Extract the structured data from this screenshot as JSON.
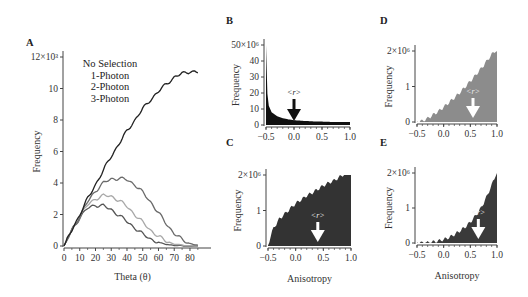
{
  "chart_data": [
    {
      "panel": "A",
      "type": "line",
      "title": "",
      "xlabel": "Theta (θ)",
      "ylabel": "Frequency",
      "y_multiplier_label": "12×10³",
      "xlim": [
        0,
        87
      ],
      "ylim": [
        0,
        12
      ],
      "x_ticks": [
        "0",
        "10",
        "20",
        "30",
        "40",
        "50",
        "60",
        "70",
        "80"
      ],
      "y_ticks": [
        "0",
        "2",
        "4",
        "6",
        "8",
        "10",
        "12×10³"
      ],
      "grid": false,
      "legend": [
        "No Selection",
        "1-Photon",
        "2-Photon",
        "3-Photon"
      ],
      "legend_position": "upper-left inside",
      "x": [
        0,
        5,
        10,
        15,
        20,
        25,
        30,
        35,
        40,
        45,
        50,
        55,
        60,
        65,
        70,
        75,
        80,
        85
      ],
      "series": [
        {
          "name": "No Selection",
          "color": "#222222",
          "values": [
            0,
            1.0,
            2.0,
            3.0,
            3.9,
            4.8,
            5.7,
            6.5,
            7.3,
            8.0,
            8.7,
            9.3,
            9.8,
            10.3,
            10.7,
            10.95,
            11.1,
            11.0
          ]
        },
        {
          "name": "1-Photon",
          "color": "#6a6a6a",
          "values": [
            0,
            1.0,
            1.9,
            2.8,
            3.5,
            4.0,
            4.25,
            4.3,
            4.2,
            3.9,
            3.4,
            2.8,
            2.1,
            1.4,
            0.8,
            0.4,
            0.15,
            0.05
          ]
        },
        {
          "name": "2-Photon",
          "color": "#a8a8a8",
          "values": [
            0,
            1.0,
            1.9,
            2.6,
            3.0,
            3.2,
            3.15,
            2.9,
            2.5,
            2.0,
            1.5,
            1.0,
            0.6,
            0.3,
            0.12,
            0.05,
            0.02,
            0.0
          ]
        },
        {
          "name": "3-Photon",
          "color": "#555555",
          "values": [
            0,
            1.0,
            1.8,
            2.4,
            2.6,
            2.55,
            2.3,
            1.95,
            1.55,
            1.15,
            0.75,
            0.45,
            0.22,
            0.1,
            0.04,
            0.01,
            0.0,
            0.0
          ]
        }
      ]
    },
    {
      "panel": "B",
      "type": "area",
      "xlabel": "",
      "ylabel": "Frequency",
      "xlim": [
        -0.5,
        1.0
      ],
      "ylim": [
        0,
        50
      ],
      "x_ticks": [
        "-0.5",
        "0.0",
        "0.5",
        "1.0"
      ],
      "y_ticks": [
        "0",
        "10",
        "20",
        "30",
        "40",
        "50×10⁶"
      ],
      "fill_color": "#111111",
      "annotation": {
        "text": "<r>",
        "x": 0.0,
        "arrow_color": "#111111"
      },
      "x": [
        -0.5,
        -0.48,
        -0.45,
        -0.4,
        -0.3,
        -0.2,
        -0.1,
        0.0,
        0.2,
        0.4,
        0.6,
        0.8,
        1.0
      ],
      "values": [
        50,
        21,
        12,
        8,
        5.5,
        4.2,
        3.5,
        3.0,
        2.5,
        2.2,
        2.0,
        1.8,
        1.8
      ]
    },
    {
      "panel": "C",
      "type": "area",
      "xlabel": "Anisotropy",
      "ylabel": "Frequency",
      "xlim": [
        -0.5,
        1.0
      ],
      "ylim": [
        0,
        2
      ],
      "x_ticks": [
        "-0.5",
        "0.0",
        "0.5",
        "1.0"
      ],
      "y_ticks": [
        "0",
        "1",
        "2×10⁶"
      ],
      "fill_color": "#333333",
      "annotation": {
        "text": "<r>",
        "x": 0.4,
        "arrow_color": "#ffffff"
      },
      "x": [
        -0.5,
        -0.45,
        -0.4,
        -0.3,
        -0.2,
        -0.1,
        0.0,
        0.1,
        0.2,
        0.3,
        0.4,
        0.5,
        0.6,
        0.7,
        0.8,
        0.9,
        1.0
      ],
      "values": [
        0,
        0.3,
        0.5,
        0.75,
        0.9,
        1.05,
        1.2,
        1.3,
        1.42,
        1.5,
        1.6,
        1.7,
        1.78,
        1.85,
        1.95,
        2.05,
        2.15
      ]
    },
    {
      "panel": "D",
      "type": "area",
      "xlabel": "",
      "ylabel": "Frequency",
      "xlim": [
        -0.5,
        1.0
      ],
      "ylim": [
        0,
        2
      ],
      "x_ticks": [
        "-0.5",
        "0.0",
        "0.5",
        "1.0"
      ],
      "y_ticks": [
        "0",
        "1",
        "2×10⁶"
      ],
      "fill_color": "#8c8c8c",
      "annotation": {
        "text": "<r>",
        "x": 0.55,
        "arrow_color": "#ffffff"
      },
      "x": [
        -0.5,
        -0.4,
        -0.3,
        -0.2,
        -0.1,
        0.0,
        0.1,
        0.2,
        0.3,
        0.4,
        0.5,
        0.6,
        0.7,
        0.8,
        0.9,
        1.0
      ],
      "values": [
        0,
        0.03,
        0.1,
        0.2,
        0.3,
        0.42,
        0.55,
        0.68,
        0.82,
        0.98,
        1.15,
        1.32,
        1.5,
        1.7,
        1.9,
        2.05
      ]
    },
    {
      "panel": "E",
      "type": "area",
      "xlabel": "Anisotropy",
      "ylabel": "Frequency",
      "xlim": [
        -0.5,
        1.0
      ],
      "ylim": [
        0,
        2
      ],
      "x_ticks": [
        "-0.5",
        "0.0",
        "0.5",
        "1.0"
      ],
      "y_ticks": [
        "0",
        "1",
        "2×10⁶"
      ],
      "fill_color": "#3a3a3a",
      "annotation": {
        "text": "<r>",
        "x": 0.65,
        "arrow_color": "#ffffff"
      },
      "x": [
        -0.5,
        -0.4,
        -0.3,
        -0.2,
        -0.1,
        0.0,
        0.1,
        0.2,
        0.3,
        0.4,
        0.5,
        0.6,
        0.7,
        0.8,
        0.9,
        1.0
      ],
      "values": [
        0,
        0.0,
        0.01,
        0.03,
        0.06,
        0.1,
        0.16,
        0.24,
        0.34,
        0.45,
        0.6,
        0.78,
        1.0,
        1.3,
        1.65,
        2.05
      ]
    }
  ],
  "labels": {
    "panel_a": "A",
    "panel_b": "B",
    "panel_c": "C",
    "panel_d": "D",
    "panel_e": "E",
    "frequency": "Frequency",
    "theta": "Theta (θ)",
    "anisotropy": "Anisotropy",
    "r_mean": "<r>"
  }
}
